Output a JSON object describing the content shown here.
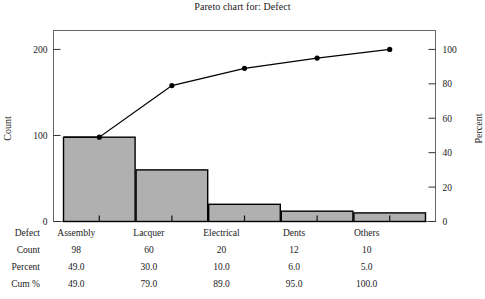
{
  "chart_data": {
    "type": "bar",
    "title": "Pareto chart for: Defect",
    "xlabel": "",
    "ylabel": "Count",
    "y2label": "Percent",
    "categories": [
      "Assembly",
      "Lacquer",
      "Electrical",
      "Dents",
      "Others"
    ],
    "values": [
      98,
      60,
      20,
      12,
      10
    ],
    "series": [
      {
        "name": "Count",
        "type": "bar",
        "values": [
          98,
          60,
          20,
          12,
          10
        ],
        "axis": "left"
      },
      {
        "name": "Cum %",
        "type": "line",
        "values": [
          49.0,
          79.0,
          89.0,
          95.0,
          100.0
        ],
        "axis": "right"
      }
    ],
    "ylim": [
      0,
      222
    ],
    "y2lim": [
      0,
      111
    ],
    "yticks": [
      0,
      100,
      200
    ],
    "ytick_labels": [
      "0",
      "100",
      "200"
    ],
    "y2ticks": [
      0,
      20,
      40,
      60,
      80,
      100
    ],
    "y2tick_labels": [
      "0",
      "20",
      "40",
      "60",
      "80",
      "100"
    ],
    "grid": false,
    "legend": "none",
    "bar_color": "#b0b0b0",
    "bar_edge_color": "#000000",
    "line_color": "#000000",
    "marker": "circle",
    "frame_color": "#555555"
  },
  "title": "Pareto chart for: Defect",
  "axes": {
    "left_title": "Count",
    "right_title": "Percent",
    "left_ticks": [
      "200",
      "100",
      "0"
    ],
    "right_ticks": [
      "100",
      "80",
      "60",
      "40",
      "20",
      "0"
    ]
  },
  "table": {
    "rows": [
      {
        "label": "Defect",
        "cells": [
          "Assembly",
          "Lacquer",
          "Electrical",
          "Dents",
          "Others"
        ]
      },
      {
        "label": "Count",
        "cells": [
          "98",
          "60",
          "20",
          "12",
          "10"
        ]
      },
      {
        "label": "Percent",
        "cells": [
          "49.0",
          "30.0",
          "10.0",
          "6.0",
          "5.0"
        ]
      },
      {
        "label": "Cum %",
        "cells": [
          "49.0",
          "79.0",
          "89.0",
          "95.0",
          "100.0"
        ]
      }
    ]
  }
}
